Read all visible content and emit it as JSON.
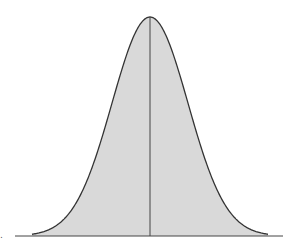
{
  "chart_data": {
    "type": "area",
    "title": "",
    "xlabel": "",
    "ylabel": "",
    "mean": 0,
    "std": 1,
    "xlim": [
      -4,
      4
    ],
    "ylim": [
      0,
      0.4
    ],
    "grid": false,
    "legend": null,
    "fill_color": "#d9d9d9",
    "line_color": "#333333",
    "mean_line": true,
    "left_mark": "."
  }
}
